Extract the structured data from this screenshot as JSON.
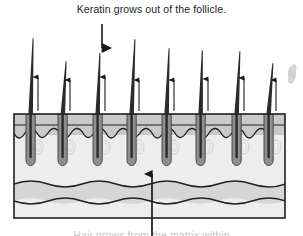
{
  "figure": {
    "title_top": "Keratin grows out of the follicle.",
    "title_bottom": "Hair grows from the matrix within",
    "alt": "Cross-section diagram of skin showing hair shafts growing out of follicles"
  },
  "annotations": {
    "arrow_down_label": "arrow pointing down to the skin surface",
    "arrow_up_label": "arrow pointing up from the dermal layer",
    "growth_arrow_label": "small upward growth arrow"
  },
  "diagram": {
    "box": {
      "x": 14,
      "y": 114,
      "width": 271,
      "height": 104
    },
    "layers": [
      {
        "name": "epidermis",
        "color": "#9d9d9d",
        "y": 114,
        "height": 11
      },
      {
        "name": "papillary-dermis",
        "color": "#c9c9c9",
        "y": 125,
        "height": 10
      },
      {
        "name": "dermis",
        "color": "#ededed",
        "y": 135,
        "height": 48
      },
      {
        "name": "subcutaneous-band",
        "color": "#d6d6d6",
        "y": 183,
        "height": 18
      },
      {
        "name": "hypodermis",
        "color": "#ededed",
        "y": 201,
        "height": 17
      }
    ],
    "colors": {
      "outline": "#231f20",
      "hair": "#2b2b2b",
      "follicle": "#8f8f8f",
      "follicle_edge": "#4a4a4a",
      "gland": "#d3d3d3",
      "smudge": "#9b9b9b"
    },
    "hair_count": 8,
    "growth_arrow_count": 8,
    "hairs": [
      {
        "base_x": 30,
        "tip_x": 33,
        "tip_y": 38
      },
      {
        "base_x": 62,
        "tip_x": 66,
        "tip_y": 61
      },
      {
        "base_x": 96,
        "tip_x": 100,
        "tip_y": 53
      },
      {
        "base_x": 131,
        "tip_x": 135,
        "tip_y": 39
      },
      {
        "base_x": 165,
        "tip_x": 169,
        "tip_y": 48
      },
      {
        "base_x": 199,
        "tip_x": 202,
        "tip_y": 50
      },
      {
        "base_x": 235,
        "tip_x": 240,
        "tip_y": 51
      },
      {
        "base_x": 268,
        "tip_x": 273,
        "tip_y": 63
      }
    ],
    "growth_arrows": [
      {
        "x": 38,
        "y_top": 77,
        "y_bottom": 111
      },
      {
        "x": 70,
        "y_top": 80,
        "y_bottom": 111
      },
      {
        "x": 105,
        "y_top": 77,
        "y_bottom": 111
      },
      {
        "x": 139,
        "y_top": 80,
        "y_bottom": 111
      },
      {
        "x": 174,
        "y_top": 80,
        "y_bottom": 111
      },
      {
        "x": 208,
        "y_top": 79,
        "y_bottom": 111
      },
      {
        "x": 244,
        "y_top": 78,
        "y_bottom": 111
      },
      {
        "x": 276,
        "y_top": 80,
        "y_bottom": 111
      }
    ],
    "arrow_down": {
      "x": 102,
      "y_top": 25,
      "y_bottom": 48
    },
    "arrow_up": {
      "x": 152,
      "y_top": 175,
      "y_bottom": 232
    },
    "smudge": {
      "x": 292,
      "y": 74
    }
  }
}
